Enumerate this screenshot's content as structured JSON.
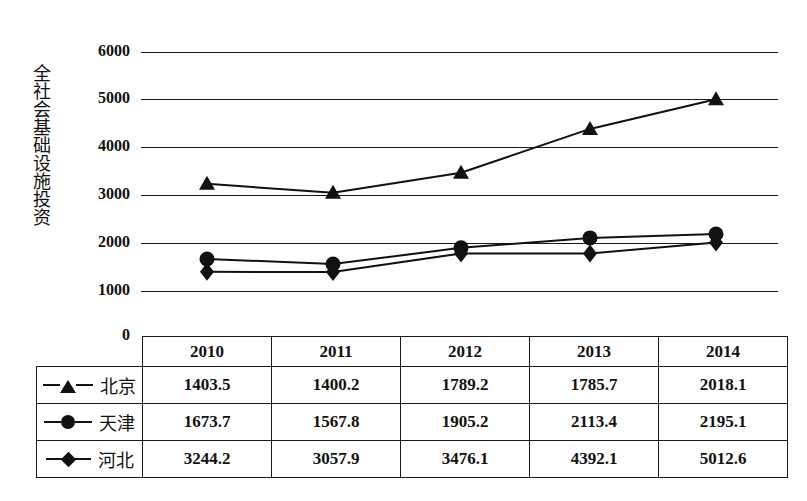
{
  "chart_data": {
    "type": "line",
    "title": "",
    "xlabel": "",
    "ylabel": "全社会基础设施投资",
    "categories": [
      "2010",
      "2011",
      "2012",
      "2013",
      "2014"
    ],
    "ylim": [
      0,
      6000
    ],
    "yticks": [
      "0",
      "1000",
      "2000",
      "3000",
      "4000",
      "5000",
      "6000"
    ],
    "grid": true,
    "legend_position": "table-left-column",
    "series": [
      {
        "name": "北京",
        "marker": "triangle",
        "values": [
          1403.5,
          1400.2,
          1789.2,
          1785.7,
          2018.1
        ]
      },
      {
        "name": "天津",
        "marker": "circle",
        "values": [
          1673.7,
          1567.8,
          1905.2,
          2113.4,
          2195.1
        ]
      },
      {
        "name": "河北",
        "marker": "diamond",
        "values": [
          3244.2,
          3057.9,
          3476.1,
          4392.1,
          5012.6
        ]
      }
    ],
    "plotted_lines": [
      {
        "marker": "triangle",
        "values": [
          3244.2,
          3057.9,
          3476.1,
          4392.1,
          5012.6
        ]
      },
      {
        "marker": "circle",
        "values": [
          1673.7,
          1567.8,
          1905.2,
          2113.4,
          2195.1
        ]
      },
      {
        "marker": "diamond",
        "values": [
          1403.5,
          1400.2,
          1789.2,
          1785.7,
          2018.1
        ]
      }
    ]
  },
  "table": {
    "corner": "",
    "columns": [
      "2010",
      "2011",
      "2012",
      "2013",
      "2014"
    ],
    "rows": [
      {
        "label": "北京",
        "marker": "triangle",
        "cells": [
          "1403.5",
          "1400.2",
          "1789.2",
          "1785.7",
          "2018.1"
        ]
      },
      {
        "label": "天津",
        "marker": "circle",
        "cells": [
          "1673.7",
          "1567.8",
          "1905.2",
          "2113.4",
          "2195.1"
        ]
      },
      {
        "label": "河北",
        "marker": "diamond",
        "cells": [
          "3244.2",
          "3057.9",
          "3476.1",
          "4392.1",
          "5012.6"
        ]
      }
    ]
  },
  "colors": {
    "ink": "#111111",
    "grid": "#1a1a1a",
    "background": "#ffffff"
  }
}
